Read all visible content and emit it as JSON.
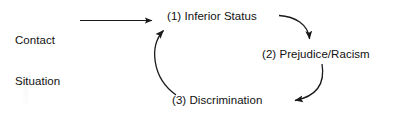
{
  "diagram": {
    "stroke_color": "#1a1a1a",
    "text_color": "#111111",
    "background_color": "#ffffff",
    "entry": {
      "label_line1": "Contact",
      "label_line2": "Situation"
    },
    "nodes": [
      {
        "id": "inferior-status",
        "label": "(1) Inferior Status"
      },
      {
        "id": "prejudice-racism",
        "label": "(2) Prejudice/Racism"
      },
      {
        "id": "discrimination",
        "label": "(3) Discrimination"
      }
    ],
    "connectors": [
      {
        "id": "entry-arrow",
        "from": "Contact Situation",
        "to": "(1) Inferior Status",
        "style": "straight"
      },
      {
        "id": "arrow-1-to-2",
        "from": "(1) Inferior Status",
        "to": "(2) Prejudice/Racism",
        "style": "curved"
      },
      {
        "id": "arrow-2-to-3",
        "from": "(2) Prejudice/Racism",
        "to": "(3) Discrimination",
        "style": "curved"
      },
      {
        "id": "arrow-3-to-1",
        "from": "(3) Discrimination",
        "to": "(1) Inferior Status",
        "style": "curved"
      }
    ]
  }
}
